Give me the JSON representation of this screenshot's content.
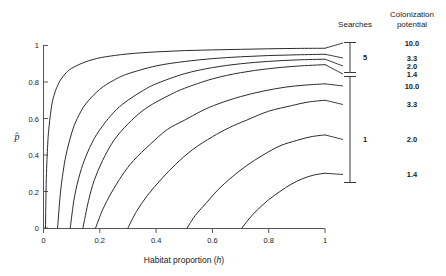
{
  "chart_data": {
    "type": "line",
    "title": "",
    "xlabel": "Habitat proportion (h)",
    "ylabel": "p̂",
    "xlim": [
      0,
      1
    ],
    "ylim": [
      0,
      1
    ],
    "xticks": [
      "0",
      "0.2",
      "0.4",
      "0.6",
      "0.8",
      "1"
    ],
    "xtick_values": [
      0,
      0.2,
      0.4,
      0.6,
      0.8,
      1
    ],
    "yticks": [
      "0",
      "0.2",
      "0.4",
      "0.6",
      "0.8",
      "1"
    ],
    "ytick_values": [
      0,
      0.2,
      0.4,
      0.6,
      0.8,
      1
    ],
    "grid": false,
    "legend_position": "right",
    "legend_headers": {
      "searches": "Searches",
      "colonization_potential_line1": "Colonization",
      "colonization_potential_line2": "potential"
    },
    "legend_groups": [
      {
        "searches": "5",
        "entries": [
          {
            "colonization_potential": "10.0"
          },
          {
            "colonization_potential": "3.3"
          },
          {
            "colonization_potential": "2.0"
          },
          {
            "colonization_potential": "1.4"
          }
        ]
      },
      {
        "searches": "1",
        "entries": [
          {
            "colonization_potential": "10.0"
          },
          {
            "colonization_potential": "3.3"
          },
          {
            "colonization_potential": "2.0"
          },
          {
            "colonization_potential": "1.4"
          }
        ]
      }
    ],
    "series": [
      {
        "name": "Searches 5, colonization potential 10.0",
        "searches": 5,
        "colonization_potential": 10.0,
        "threshold_h": 0.007,
        "p_at_h1": 0.985,
        "x": [
          0.007,
          0.01,
          0.015,
          0.02,
          0.03,
          0.04,
          0.05,
          0.06,
          0.08,
          0.1,
          0.14,
          0.18,
          0.22,
          0.3,
          0.4,
          0.5,
          0.6,
          0.7,
          0.8,
          0.9,
          1.0
        ],
        "y": [
          0,
          0.27,
          0.46,
          0.56,
          0.68,
          0.74,
          0.78,
          0.81,
          0.85,
          0.875,
          0.905,
          0.925,
          0.938,
          0.954,
          0.965,
          0.972,
          0.976,
          0.979,
          0.982,
          0.984,
          0.985
        ]
      },
      {
        "name": "Searches 5, colonization potential 3.3",
        "searches": 5,
        "colonization_potential": 3.3,
        "threshold_h": 0.05,
        "p_at_h1": 0.952,
        "x": [
          0.05,
          0.06,
          0.07,
          0.08,
          0.1,
          0.12,
          0.15,
          0.2,
          0.25,
          0.3,
          0.4,
          0.5,
          0.6,
          0.7,
          0.8,
          0.9,
          1.0
        ],
        "y": [
          0,
          0.19,
          0.31,
          0.4,
          0.52,
          0.6,
          0.68,
          0.76,
          0.81,
          0.845,
          0.888,
          0.912,
          0.928,
          0.938,
          0.945,
          0.949,
          0.952
        ]
      },
      {
        "name": "Searches 5, colonization potential 2.0",
        "searches": 5,
        "colonization_potential": 2.0,
        "threshold_h": 0.095,
        "p_at_h1": 0.925,
        "x": [
          0.095,
          0.11,
          0.13,
          0.15,
          0.18,
          0.22,
          0.26,
          0.3,
          0.35,
          0.4,
          0.5,
          0.6,
          0.7,
          0.8,
          0.9,
          1.0
        ],
        "y": [
          0,
          0.17,
          0.3,
          0.39,
          0.49,
          0.58,
          0.65,
          0.7,
          0.75,
          0.79,
          0.845,
          0.879,
          0.9,
          0.913,
          0.921,
          0.925
        ]
      },
      {
        "name": "Searches 5, colonization potential 1.4",
        "searches": 5,
        "colonization_potential": 1.4,
        "threshold_h": 0.14,
        "p_at_h1": 0.895,
        "x": [
          0.14,
          0.16,
          0.18,
          0.21,
          0.25,
          0.3,
          0.35,
          0.4,
          0.45,
          0.5,
          0.6,
          0.7,
          0.8,
          0.9,
          1.0
        ],
        "y": [
          0,
          0.15,
          0.26,
          0.37,
          0.48,
          0.57,
          0.64,
          0.69,
          0.73,
          0.765,
          0.817,
          0.851,
          0.873,
          0.887,
          0.895
        ]
      },
      {
        "name": "Searches 1, colonization potential 10.0",
        "searches": 1,
        "colonization_potential": 10.0,
        "threshold_h": 0.185,
        "p_at_h1": 0.79,
        "x": [
          0.185,
          0.21,
          0.24,
          0.28,
          0.32,
          0.38,
          0.44,
          0.5,
          0.56,
          0.62,
          0.7,
          0.78,
          0.86,
          0.93,
          1.0
        ],
        "y": [
          0,
          0.1,
          0.19,
          0.29,
          0.37,
          0.46,
          0.54,
          0.59,
          0.64,
          0.68,
          0.72,
          0.75,
          0.772,
          0.783,
          0.79
        ]
      },
      {
        "name": "Searches 1, colonization potential 3.3",
        "searches": 1,
        "colonization_potential": 3.3,
        "threshold_h": 0.3,
        "p_at_h1": 0.7,
        "x": [
          0.3,
          0.33,
          0.37,
          0.42,
          0.47,
          0.53,
          0.6,
          0.66,
          0.72,
          0.8,
          0.88,
          0.94,
          1.0
        ],
        "y": [
          0,
          0.09,
          0.18,
          0.27,
          0.35,
          0.43,
          0.5,
          0.55,
          0.59,
          0.64,
          0.67,
          0.69,
          0.7
        ]
      },
      {
        "name": "Searches 1, colonization potential 2.0",
        "searches": 1,
        "colonization_potential": 2.0,
        "threshold_h": 0.51,
        "p_at_h1": 0.51,
        "x": [
          0.51,
          0.54,
          0.58,
          0.62,
          0.67,
          0.72,
          0.78,
          0.84,
          0.9,
          0.95,
          1.0
        ],
        "y": [
          0,
          0.07,
          0.14,
          0.21,
          0.28,
          0.34,
          0.4,
          0.45,
          0.48,
          0.5,
          0.51
        ]
      },
      {
        "name": "Searches 1, colonization potential 1.4",
        "searches": 1,
        "colonization_potential": 1.4,
        "threshold_h": 0.705,
        "p_at_h1": 0.3,
        "x": [
          0.705,
          0.73,
          0.76,
          0.8,
          0.84,
          0.88,
          0.92,
          0.96,
          1.0
        ],
        "y": [
          0,
          0.05,
          0.1,
          0.155,
          0.2,
          0.24,
          0.27,
          0.29,
          0.3
        ]
      }
    ]
  }
}
